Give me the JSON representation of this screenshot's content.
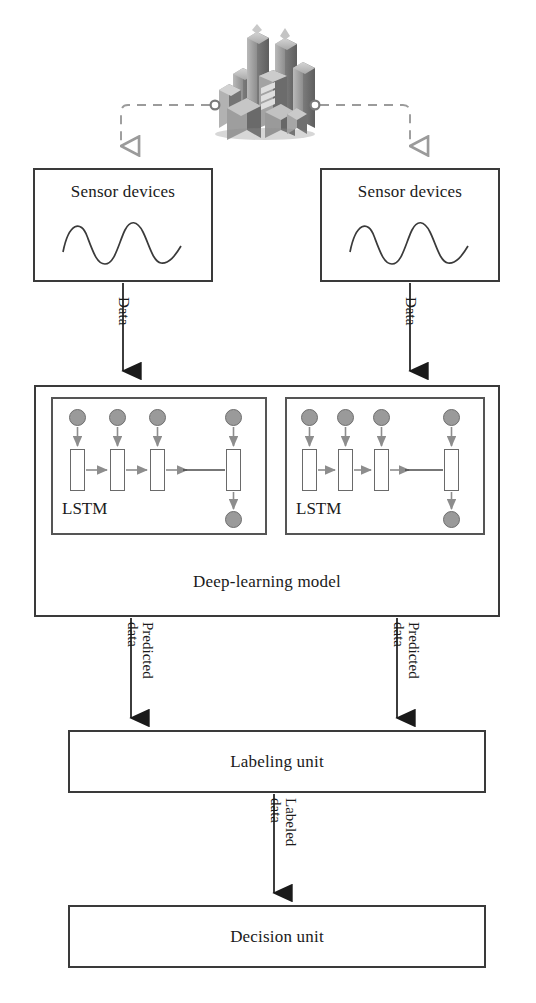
{
  "diagram": {
    "nodes": {
      "city_icon": "city-buildings-icon",
      "sensor_left": "Sensor devices",
      "sensor_right": "Sensor devices",
      "waveform": "sine-wave-icon",
      "lstm_left": "LSTM",
      "lstm_right": "LSTM",
      "deep_learning_model": "Deep-learning model",
      "labeling_unit": "Labeling unit",
      "decision_unit": "Decision unit"
    },
    "edges": {
      "city_to_sensor_left": "",
      "city_to_sensor_right": "",
      "sensor_left_to_model": "Data",
      "sensor_right_to_model": "Data",
      "model_left_to_labeling": "Predicted data",
      "model_left_to_labeling_line1": "Predicted",
      "model_left_to_labeling_line2": "data",
      "model_right_to_labeling": "Predicted data",
      "model_right_to_labeling_line1": "Predicted",
      "model_right_to_labeling_line2": "data",
      "labeling_to_decision": "Labeled data",
      "labeling_to_decision_line1": "Labeled",
      "labeling_to_decision_line2": "data"
    },
    "lstm_detail": {
      "input_node_count": 4,
      "cell_count": 4,
      "output_node_count": 1,
      "ellipsis_gap": true
    },
    "colors": {
      "box_border": "#3a3a3a",
      "inner_border": "#555555",
      "node_fill": "#9a9a9a",
      "node_stroke": "#6e6e6e",
      "arrow_gray": "#8d8d8d",
      "arrow_black": "#1a1a1a",
      "dashed_gray": "#9b9b9b",
      "text": "#1a1a1a",
      "background": "#ffffff"
    }
  }
}
